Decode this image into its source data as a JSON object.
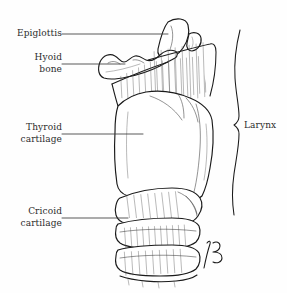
{
  "figure": {
    "background_color": "#fefefe",
    "ink_color": "#1a1a1a",
    "text_color": "#2b2b2b",
    "signature": "JB"
  },
  "labels": {
    "epiglottis": "Epiglottis",
    "hyoid_line1": "Hyoid",
    "hyoid_line2": "bone",
    "thyroid_line1": "Thyroid",
    "thyroid_line2": "cartilage",
    "cricoid_line1": "Cricoid",
    "cricoid_line2": "cartilage",
    "larynx": "Larynx"
  },
  "structures": [
    {
      "name": "epiglottis",
      "label": "Epiglottis"
    },
    {
      "name": "hyoid-bone",
      "label": "Hyoid bone"
    },
    {
      "name": "thyrohyoid-membrane",
      "label": "Thyrohyoid membrane"
    },
    {
      "name": "thyroid-cartilage",
      "label": "Thyroid cartilage"
    },
    {
      "name": "cricothyroid-membrane",
      "label": "Cricothyroid membrane"
    },
    {
      "name": "cricoid-cartilage",
      "label": "Cricoid cartilage"
    },
    {
      "name": "tracheal-ring-1",
      "label": "Tracheal ring"
    },
    {
      "name": "tracheal-ring-2",
      "label": "Tracheal ring"
    },
    {
      "name": "neck-contour",
      "label": "Neck contour"
    }
  ],
  "leaders": {
    "epiglottis": "62,34 to 168,34",
    "hyoid": "62,64 to 125,64",
    "thyroid": "62,134 to 143,134",
    "cricoid": "62,218 to 128,218",
    "larynx": "bracket notch at 238,125"
  }
}
